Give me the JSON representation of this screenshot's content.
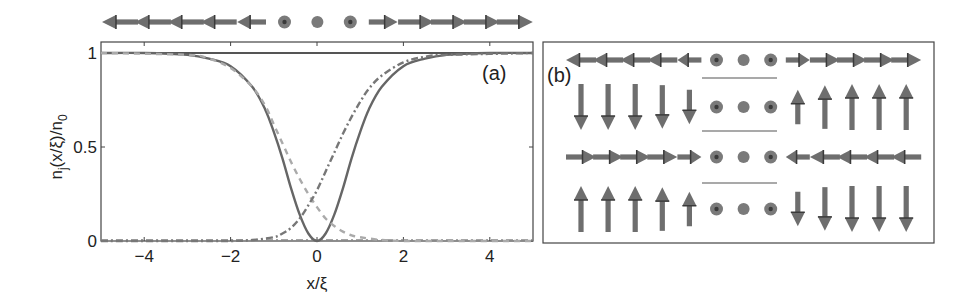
{
  "chart_data": [
    {
      "panel": "(a)",
      "type": "line",
      "title": "",
      "xlabel": "x/ξ",
      "ylabel": "n_j(x/ξ)/n_0",
      "xlim": [
        -5,
        5
      ],
      "ylim": [
        0,
        1.02
      ],
      "xticks": [
        -4,
        -2,
        0,
        2,
        4
      ],
      "xtick_labels": [
        "−4",
        "−2",
        "0",
        "2",
        "4"
      ],
      "yticks": [
        0,
        0.5,
        1
      ],
      "ytick_labels": [
        "0",
        "0.5",
        "1"
      ],
      "grid": false,
      "legend": null,
      "annotation": "(a)",
      "series": [
        {
          "name": "total density",
          "style": "solid",
          "color": "#555555",
          "x": [
            -5,
            5
          ],
          "y": [
            1,
            1
          ]
        },
        {
          "name": "component (solid dip)",
          "style": "solid",
          "color": "#666666",
          "x": [
            -5,
            -4,
            -3,
            -2.5,
            -2,
            -1.5,
            -1.2,
            -1,
            -0.8,
            -0.6,
            -0.4,
            -0.2,
            0,
            0.2,
            0.4,
            0.6,
            0.8,
            1,
            1.2,
            1.5,
            2,
            2.5,
            3,
            4,
            5
          ],
          "y": [
            1.0,
            1.0,
            0.99,
            0.97,
            0.93,
            0.82,
            0.7,
            0.58,
            0.44,
            0.28,
            0.14,
            0.04,
            0.0,
            0.04,
            0.14,
            0.28,
            0.44,
            0.58,
            0.7,
            0.82,
            0.93,
            0.97,
            0.99,
            1.0,
            1.0
          ]
        },
        {
          "name": "component (dashed, decreasing)",
          "style": "dashed",
          "color": "#aaaaaa",
          "x": [
            -5,
            -3,
            -2.5,
            -2,
            -1.5,
            -1.2,
            -1,
            -0.8,
            -0.6,
            -0.4,
            -0.2,
            0,
            0.2,
            0.4,
            0.6,
            0.8,
            1,
            1.5,
            2,
            3,
            5
          ],
          "y": [
            1.0,
            0.99,
            0.97,
            0.92,
            0.82,
            0.72,
            0.62,
            0.52,
            0.42,
            0.33,
            0.25,
            0.18,
            0.12,
            0.08,
            0.05,
            0.03,
            0.02,
            0.005,
            0.0,
            0.0,
            0.0
          ]
        },
        {
          "name": "component (dash-dot, increasing)",
          "style": "dashdot",
          "color": "#777777",
          "x": [
            -5,
            -3,
            -2,
            -1.5,
            -1,
            -0.8,
            -0.6,
            -0.4,
            -0.2,
            0,
            0.2,
            0.4,
            0.6,
            0.8,
            1,
            1.2,
            1.5,
            2,
            2.5,
            3,
            5
          ],
          "y": [
            0.0,
            0.0,
            0.0,
            0.005,
            0.02,
            0.04,
            0.07,
            0.12,
            0.19,
            0.27,
            0.37,
            0.47,
            0.57,
            0.66,
            0.74,
            0.81,
            0.88,
            0.95,
            0.98,
            0.99,
            1.0
          ]
        }
      ]
    },
    {
      "panel": "(b)",
      "type": "diagram",
      "annotation": "(b)",
      "description": "Spin texture arrows across four rows, 13 columns each",
      "columns": 13,
      "rows": [
        {
          "name": "row-1",
          "directions": [
            "left",
            "left",
            "left",
            "left",
            "left",
            "dot",
            "dot",
            "dot",
            "right",
            "right",
            "right",
            "right",
            "right"
          ],
          "lengths": [
            1,
            1,
            1,
            1,
            0.8,
            0.2,
            0.15,
            0.2,
            0.8,
            1,
            1,
            1,
            1
          ]
        },
        {
          "name": "row-2",
          "directions": [
            "down",
            "down",
            "down",
            "down",
            "down",
            "dot",
            "dot",
            "dot",
            "up",
            "up",
            "up",
            "up",
            "up"
          ],
          "lengths": [
            1,
            1,
            1,
            0.95,
            0.75,
            0.25,
            0.15,
            0.25,
            0.75,
            0.95,
            1,
            1,
            1
          ]
        },
        {
          "name": "row-3",
          "directions": [
            "right",
            "right",
            "right",
            "right",
            "right",
            "dot",
            "dot",
            "dot",
            "left",
            "left",
            "left",
            "left",
            "left"
          ],
          "lengths": [
            1,
            1,
            1,
            1,
            0.8,
            0.2,
            0.15,
            0.2,
            0.8,
            1,
            1,
            1,
            1
          ]
        },
        {
          "name": "row-4",
          "directions": [
            "up",
            "up",
            "up",
            "up",
            "up",
            "dot",
            "dot",
            "dot",
            "down",
            "down",
            "down",
            "down",
            "down"
          ],
          "lengths": [
            1,
            1,
            1,
            0.95,
            0.75,
            0.25,
            0.15,
            0.25,
            0.75,
            0.95,
            1,
            1,
            1
          ]
        }
      ]
    }
  ],
  "top_arrow_row": {
    "directions": [
      "left",
      "left",
      "left",
      "left",
      "left",
      "dot",
      "dot",
      "dot",
      "right",
      "right",
      "right",
      "right",
      "right"
    ],
    "lengths": [
      1,
      1,
      1,
      1,
      0.8,
      0.2,
      0.15,
      0.2,
      0.8,
      1,
      1,
      1,
      1
    ]
  },
  "labels": {
    "panel_a": "(a)",
    "panel_b": "(b)",
    "xlabel": "x/ξ",
    "ylabel_main": "n",
    "ylabel_sub_j": "j",
    "ylabel_mid": "(x/ξ)/n",
    "ylabel_sub_0": "0"
  },
  "colors": {
    "axis": "#444444",
    "arrow": "#6e6e6e",
    "arrow_dark": "#3a3a3a",
    "dot": "#7a7a7a"
  }
}
